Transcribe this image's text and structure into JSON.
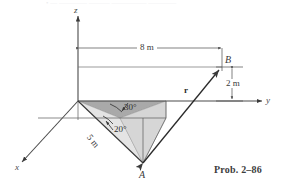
{
  "figure": {
    "caption": "Prob. 2–86",
    "header_remnant": "•  — ————  ———  ————— ————",
    "background_color": "#ffffff",
    "line_color": "#3a3a3a",
    "dark_shade_color": "#a9a9a9",
    "light_shade_color": "#e2e2e2",
    "mid_shade_color": "#d2d2d2"
  },
  "axes": [
    {
      "name": "z-axis",
      "label": "z",
      "direction": "up"
    },
    {
      "name": "y-axis",
      "label": "y",
      "direction": "right"
    },
    {
      "name": "x-axis",
      "label": "x",
      "direction": "down-left"
    }
  ],
  "points": [
    {
      "name": "point-b",
      "label": "B"
    },
    {
      "name": "point-a",
      "label": "A"
    }
  ],
  "dimensions": [
    {
      "name": "horizontal-span",
      "label": "8 m",
      "value": 8,
      "unit": "m",
      "axis": "y"
    },
    {
      "name": "vertical-height",
      "label": "2 m",
      "value": 2,
      "unit": "m",
      "axis": "z"
    },
    {
      "name": "slant-length",
      "label": "5 m",
      "value": 5,
      "unit": "m",
      "member": "OA"
    }
  ],
  "angles": [
    {
      "name": "angle-30",
      "label": "30°",
      "value": 30,
      "unit": "deg",
      "plane": "horizontal"
    },
    {
      "name": "angle-20",
      "label": "20°",
      "value": 20,
      "unit": "deg",
      "plane": "vertical"
    }
  ],
  "vectors": [
    {
      "name": "vector-r",
      "label": "r",
      "from": "A",
      "to": "B",
      "style": "double-arrow"
    }
  ]
}
